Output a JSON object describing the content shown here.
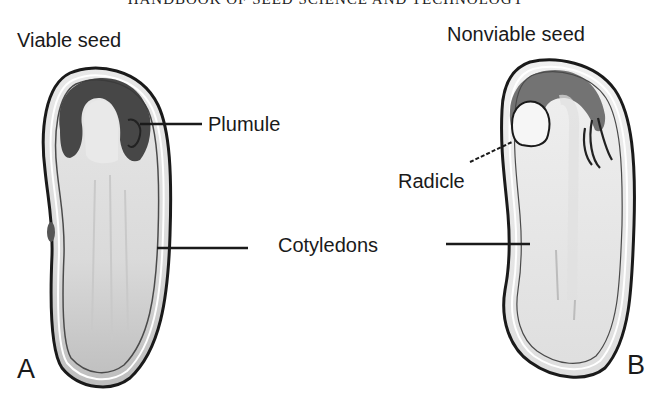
{
  "running_head": "HANDBOOK OF SEED SCIENCE AND TECHNOLOGY",
  "figure": {
    "panels": [
      {
        "letter": "A",
        "title": "Viable seed"
      },
      {
        "letter": "B",
        "title": "Nonviable seed"
      }
    ],
    "labels": {
      "plumule": "Plumule",
      "radicle": "Radicle",
      "cotyledons": "Cotyledons"
    }
  },
  "colors": {
    "outline": "#1a1a1a",
    "embryo_axis_dark": "#3a3a3a",
    "cotyledon_fill": "#d8d8d8",
    "cotyledon_fill_light": "#ececec",
    "background": "#ffffff"
  }
}
